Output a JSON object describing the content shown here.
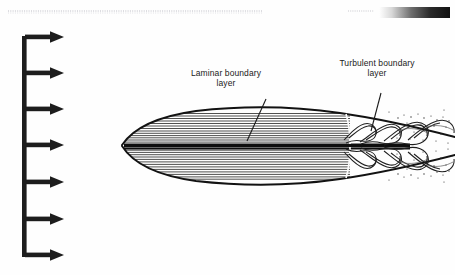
{
  "figure": {
    "kind": "boundary-layer-over-slender-body",
    "background_color": "#fefefe",
    "ink_color": "#1a1a1a",
    "annotations": [
      {
        "id": "laminar",
        "text": "Laminar boundary\nlayer",
        "x": 168,
        "y": 68
      },
      {
        "id": "turbulent",
        "text": "Turbulent boundary\nlayer",
        "x": 318,
        "y": 58
      }
    ],
    "leaders": [
      {
        "id": "laminar-leader",
        "x1": 266,
        "y1": 99,
        "x2": 247,
        "y2": 141
      },
      {
        "id": "turbulent-leader",
        "x1": 381,
        "y1": 93,
        "x2": 371,
        "y2": 131
      }
    ],
    "freestream": {
      "label": "uniform freestream velocity profile",
      "spine_x": 25,
      "spine_top": 36,
      "spine_bottom": 256,
      "arrow_tip_x": 63,
      "arrow_count": 7,
      "arrow_rows_y": [
        37,
        73,
        109,
        145,
        182,
        219,
        255
      ]
    },
    "body": {
      "nose_x": 122,
      "nose_y": 145,
      "tail_x": 455,
      "chord_axis_y": 146,
      "transition_x": 347,
      "streamline_count": 26
    },
    "scan_artifacts": {
      "gradient_bar": {
        "x": 379,
        "y": 7,
        "width": 71,
        "height": 11,
        "from": "#ffffff",
        "to": "#111111"
      },
      "dotted_rule": {
        "x1": 8,
        "x2": 262,
        "y": 11,
        "color": "#cfcfd4"
      }
    }
  }
}
